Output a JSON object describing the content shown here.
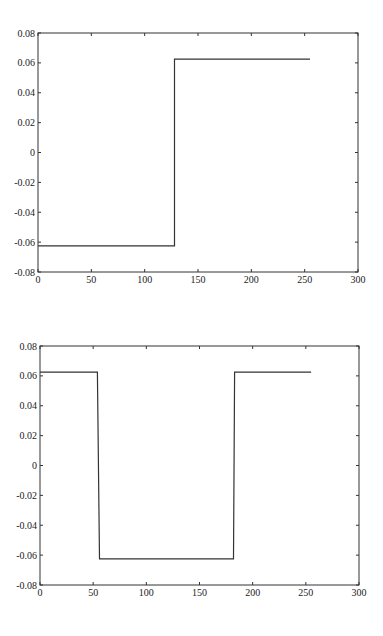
{
  "chart_data": [
    {
      "type": "line",
      "title": "",
      "xlabel": "",
      "ylabel": "",
      "xlim": [
        0,
        300
      ],
      "ylim": [
        -0.08,
        0.08
      ],
      "grid": false,
      "legend": null,
      "x_ticks": [
        0,
        50,
        100,
        150,
        200,
        250,
        300
      ],
      "x_tick_labels": [
        "0",
        "50",
        "100",
        "150",
        "200",
        "250",
        "300"
      ],
      "y_ticks": [
        -0.08,
        -0.06,
        -0.04,
        -0.02,
        0,
        0.02,
        0.04,
        0.06,
        0.08
      ],
      "y_tick_labels": [
        "-0.08",
        "-0.06",
        "-0.04",
        "-0.02",
        "0",
        "0.02",
        "0.04",
        "0.06",
        "0.08"
      ],
      "series": [
        {
          "name": "signal",
          "color": "#333333",
          "x": [
            0,
            128,
            128,
            255
          ],
          "y": [
            -0.0625,
            -0.0625,
            0.0625,
            0.0625
          ]
        }
      ],
      "frame": {
        "left": 38,
        "top": 33,
        "right": 358,
        "bottom": 272
      }
    },
    {
      "type": "line",
      "title": "",
      "xlabel": "",
      "ylabel": "",
      "xlim": [
        0,
        300
      ],
      "ylim": [
        -0.08,
        0.08
      ],
      "grid": false,
      "legend": null,
      "x_ticks": [
        0,
        50,
        100,
        150,
        200,
        250,
        300
      ],
      "x_tick_labels": [
        "0",
        "50",
        "100",
        "150",
        "200",
        "250",
        "300"
      ],
      "y_ticks": [
        -0.08,
        -0.06,
        -0.04,
        -0.02,
        0,
        0.02,
        0.04,
        0.06,
        0.08
      ],
      "y_tick_labels": [
        "-0.08",
        "-0.06",
        "-0.04",
        "-0.02",
        "0",
        "0.02",
        "0.04",
        "0.06",
        "0.08"
      ],
      "series": [
        {
          "name": "signal",
          "color": "#333333",
          "x": [
            0,
            54,
            56,
            182,
            183,
            255
          ],
          "y": [
            0.0625,
            0.0625,
            -0.0625,
            -0.0625,
            0.0625,
            0.0625
          ]
        }
      ],
      "frame": {
        "left": 40,
        "top": 346,
        "right": 359,
        "bottom": 585
      }
    }
  ]
}
